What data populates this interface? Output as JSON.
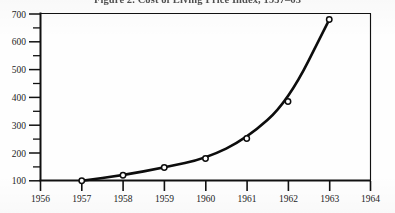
{
  "figure": {
    "title": "Figure 2.  Cost of Living Price Index, 1957–63",
    "caption_number": "Figure 2."
  },
  "chart_data": {
    "type": "line",
    "title": "Figure 2.  Cost of Living Price Index, 1957–63",
    "xlabel": "",
    "ylabel": "",
    "x": [
      1957,
      1958,
      1959,
      1960,
      1961,
      1962,
      1963
    ],
    "values": [
      100,
      120,
      148,
      180,
      252,
      385,
      680
    ],
    "series": [
      {
        "name": "Cost of Living Price Index",
        "values": [
          100,
          120,
          148,
          180,
          252,
          385,
          680
        ]
      }
    ],
    "xlim": [
      1956,
      1964
    ],
    "ylim": [
      100,
      700
    ],
    "x_tick_labels": [
      "1956",
      "1957",
      "1958",
      "1959",
      "1960",
      "1961",
      "1962",
      "1963",
      "1964"
    ],
    "y_tick_labels": [
      "100",
      "200",
      "300",
      "400",
      "500",
      "600",
      "700"
    ],
    "y_major_ticks": [
      100,
      200,
      300,
      400,
      500,
      600,
      700
    ],
    "y_minor_ticks": [
      150,
      250,
      350,
      450,
      550,
      650
    ],
    "grid": false,
    "legend": "none",
    "marker": "open-circle",
    "line_color": "#0d0d0d",
    "marker_fill": "#ffffff",
    "background": "#fefefe"
  },
  "axes": {
    "y_ticks": [
      {
        "label": "700",
        "value": 700
      },
      {
        "label": "600",
        "value": 600
      },
      {
        "label": "500",
        "value": 500
      },
      {
        "label": "400",
        "value": 400
      },
      {
        "label": "300",
        "value": 300
      },
      {
        "label": "200",
        "value": 200
      },
      {
        "label": "100",
        "value": 100
      }
    ],
    "x_ticks": [
      {
        "label": "1956",
        "value": 1956
      },
      {
        "label": "1957",
        "value": 1957
      },
      {
        "label": "1958",
        "value": 1958
      },
      {
        "label": "1959",
        "value": 1959
      },
      {
        "label": "1960",
        "value": 1960
      },
      {
        "label": "1961",
        "value": 1961
      },
      {
        "label": "1962",
        "value": 1962
      },
      {
        "label": "1963",
        "value": 1963
      },
      {
        "label": "1964",
        "value": 1964
      }
    ]
  }
}
